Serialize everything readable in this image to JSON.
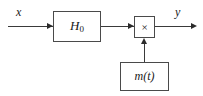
{
  "diagram": {
    "type": "signal-flow-block-diagram",
    "colors": {
      "background": "#ffffff",
      "block_border": "#4a4a4a",
      "block_fill": "#ffffff",
      "wire": "#3a3a3a",
      "arrowhead": "#2b2b2b",
      "text": "#1a1a1a"
    },
    "signals": {
      "input_label": "x",
      "output_label": "y"
    },
    "blocks": [
      {
        "id": "filter",
        "label": "H",
        "subscript": "0",
        "shape": "rectangle"
      },
      {
        "id": "multiplier",
        "label": "×",
        "shape": "rectangle"
      },
      {
        "id": "modulator",
        "label": "m(t)",
        "shape": "rectangle"
      }
    ],
    "connections": [
      {
        "from": "input",
        "to": "filter",
        "direction": "right"
      },
      {
        "from": "filter",
        "to": "multiplier",
        "direction": "right"
      },
      {
        "from": "multiplier",
        "to": "output",
        "direction": "right"
      },
      {
        "from": "modulator",
        "to": "multiplier",
        "direction": "up"
      }
    ]
  }
}
